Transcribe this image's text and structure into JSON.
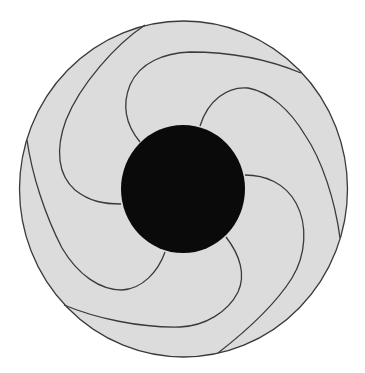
{
  "diagram": {
    "type": "spiral-impeller",
    "width": 365,
    "height": 373,
    "colors": {
      "background": "#ffffff",
      "disk_fill": "#dcdcdc",
      "stroke": "#3a3a3a",
      "hub_fill": "#0a0a0a"
    },
    "outer_disk": {
      "cx": 183.5,
      "cy": 189,
      "rx": 164,
      "ry": 168
    },
    "hub": {
      "cx": 183,
      "cy": 189,
      "rx": 62,
      "ry": 64
    },
    "blades": [
      {
        "id": 1,
        "d": "M145,25 C115,45 80,85 66,120 C55,150 58,175 75,190 C90,202 105,204 121,204"
      },
      {
        "id": 2,
        "d": "M301,73 C270,60 230,52 190,52 C165,53 140,62 130,85 C122,105 126,125 140,142"
      },
      {
        "id": 3,
        "d": "M340,238 C335,200 322,160 305,135 C290,110 270,92 248,88 C228,86 208,100 200,126"
      },
      {
        "id": 4,
        "d": "M218,353 C245,332 275,305 292,278 C306,255 308,225 296,203 C285,183 265,175 245,175"
      },
      {
        "id": 5,
        "d": "M64,305 C95,318 140,328 180,327 C205,326 228,312 238,292 C246,275 240,255 226,237"
      },
      {
        "id": 6,
        "d": "M27,140 C32,175 45,215 62,248 C78,275 100,290 122,290 C142,289 158,272 165,252"
      }
    ]
  }
}
